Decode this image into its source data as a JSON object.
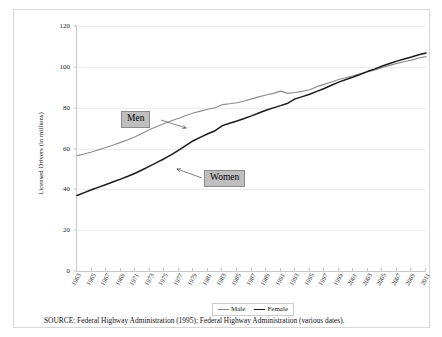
{
  "figure": {
    "source_note": "SOURCE:  Federal Highway Administration (1995); Federal Highway Administration (various dates)."
  },
  "annotations": {
    "men_label": "Men",
    "women_label": "Women"
  },
  "colors": {
    "male_line": "#8c8c8c",
    "female_line": "#1a1a1a",
    "gridline": "#ebebeb",
    "axis": "#c9c9c9",
    "callout_fill": "#bfbfbf",
    "frame": "#d8d8d8"
  },
  "legend": {
    "position": "bottom-center",
    "entries": [
      {
        "label": "Male",
        "color": "#8c8c8c"
      },
      {
        "label": "Female",
        "color": "#1a1a1a"
      }
    ]
  },
  "chart_data": {
    "type": "line",
    "title": "",
    "xlabel": "",
    "ylabel": "Licensed Drivers (in millions)",
    "grid": true,
    "ylim": [
      0,
      120
    ],
    "yticks": [
      0,
      20,
      40,
      60,
      80,
      100,
      120
    ],
    "xlim": [
      1963,
      2011
    ],
    "xticks": [
      1963,
      1965,
      1967,
      1969,
      1971,
      1973,
      1975,
      1977,
      1979,
      1981,
      1983,
      1985,
      1987,
      1989,
      1991,
      1993,
      1995,
      1997,
      1999,
      2001,
      2003,
      2005,
      2007,
      2009,
      2011
    ],
    "x": [
      1963,
      1964,
      1965,
      1966,
      1967,
      1968,
      1969,
      1970,
      1971,
      1972,
      1973,
      1974,
      1975,
      1976,
      1977,
      1978,
      1979,
      1980,
      1981,
      1982,
      1983,
      1984,
      1985,
      1986,
      1987,
      1988,
      1989,
      1990,
      1991,
      1992,
      1993,
      1994,
      1995,
      1996,
      1997,
      1998,
      1999,
      2000,
      2001,
      2002,
      2003,
      2004,
      2005,
      2006,
      2007,
      2008,
      2009,
      2010,
      2011
    ],
    "series": [
      {
        "name": "Male",
        "color": "#8c8c8c",
        "values": [
          56.5,
          57.3,
          58.3,
          59.4,
          60.5,
          61.7,
          63.0,
          64.3,
          65.8,
          67.5,
          69.3,
          70.8,
          72.2,
          73.6,
          74.8,
          76.2,
          77.4,
          78.3,
          79.2,
          80.0,
          81.5,
          81.9,
          82.4,
          83.3,
          84.3,
          85.3,
          86.2,
          87.0,
          88.1,
          87.0,
          87.4,
          88.0,
          88.8,
          90.3,
          91.4,
          92.6,
          93.8,
          94.8,
          95.6,
          96.6,
          97.6,
          98.5,
          99.7,
          100.7,
          101.7,
          102.5,
          103.3,
          104.3,
          105.0
        ]
      },
      {
        "name": "Female",
        "color": "#1a1a1a",
        "values": [
          37.0,
          38.4,
          39.8,
          41.1,
          42.4,
          43.7,
          45.0,
          46.4,
          47.9,
          49.6,
          51.4,
          53.2,
          55.0,
          57.0,
          59.2,
          61.5,
          63.8,
          65.6,
          67.2,
          68.7,
          71.2,
          72.4,
          73.5,
          74.7,
          76.0,
          77.4,
          78.7,
          79.9,
          81.0,
          82.2,
          84.3,
          85.4,
          86.6,
          88.0,
          89.4,
          91.0,
          92.5,
          93.8,
          95.0,
          96.4,
          97.8,
          99.0,
          100.4,
          101.6,
          102.8,
          103.8,
          104.8,
          105.9,
          106.8
        ]
      }
    ]
  }
}
